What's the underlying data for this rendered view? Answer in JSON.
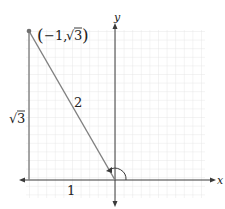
{
  "diagram": {
    "type": "unit-circle-reference-triangle",
    "point_label": "(−1, √3)",
    "point_label_parts": {
      "open": "(",
      "neg": "−1,",
      "root": "√",
      "radicand": "3",
      "close": ")"
    },
    "hypotenuse_label": "2",
    "vertical_leg_label": "√3",
    "vertical_leg_root": "√",
    "vertical_leg_radicand": "3",
    "horizontal_leg_label": "1",
    "x_axis_label": "x",
    "y_axis_label": "y",
    "colors": {
      "line": "#808080",
      "axis": "#3a3a3a",
      "grid": "#e4e4e4",
      "point": "#707070",
      "text": "#222222"
    }
  }
}
